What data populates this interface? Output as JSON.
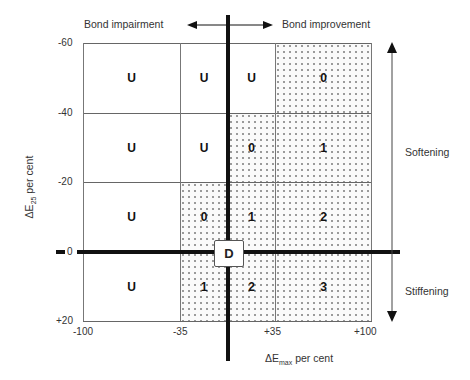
{
  "header": {
    "left_label": "Bond impairment",
    "right_label": "Bond improvement"
  },
  "side_labels": {
    "upper": "Softening",
    "lower": "Stiffening"
  },
  "axes": {
    "x_label_main": "ΔE",
    "x_label_sub": "max",
    "x_label_suffix": " per cent",
    "y_label_main": "ΔE",
    "y_label_sub": "25",
    "y_label_suffix": " per cent",
    "x_ticks": [
      "-100",
      "-35",
      "+35",
      "+100"
    ],
    "y_ticks": [
      "-60",
      "-40",
      "-20",
      "0",
      "+20"
    ]
  },
  "center_marker": "D",
  "grid": {
    "rows": [
      [
        "U",
        "U",
        "U",
        "0"
      ],
      [
        "U",
        "U",
        "0",
        "1"
      ],
      [
        "U",
        "0",
        "1",
        "2"
      ],
      [
        "U",
        "1",
        "2",
        "3"
      ]
    ],
    "shaded": [
      [
        false,
        false,
        false,
        true
      ],
      [
        false,
        false,
        true,
        true
      ],
      [
        false,
        true,
        true,
        true
      ],
      [
        false,
        true,
        true,
        true
      ]
    ]
  },
  "colors": {
    "line": "#111111",
    "grid": "#777777",
    "dot": "#666666"
  }
}
